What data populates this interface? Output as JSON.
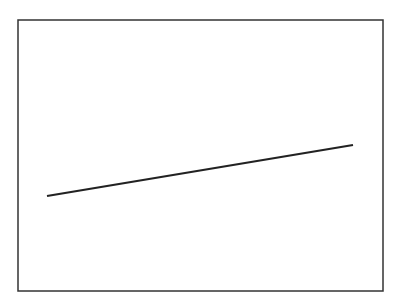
{
  "chart_data": {
    "type": "line",
    "title": "",
    "xlabel": "",
    "ylabel": "",
    "grid": false,
    "legend": null,
    "frame": {
      "left": 18,
      "top": 20,
      "right": 383,
      "bottom": 291
    },
    "series": [
      {
        "name": "line",
        "color": "#222222",
        "points_px": [
          [
            47,
            196
          ],
          [
            353,
            145
          ]
        ]
      }
    ]
  },
  "colors": {
    "frame": "#333333",
    "line": "#222222",
    "background": "#ffffff"
  }
}
